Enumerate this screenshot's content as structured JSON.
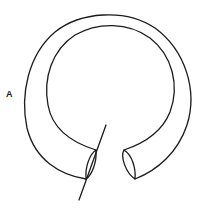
{
  "figure": {
    "label": "A",
    "stroke_color": "#1a1a1a",
    "background": "#ffffff"
  }
}
